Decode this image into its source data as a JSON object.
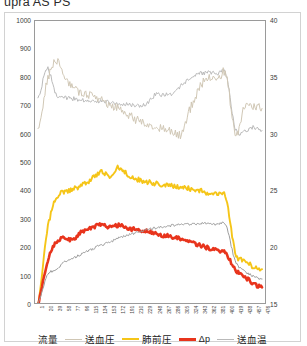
{
  "title": "upra AS PS",
  "axes": {
    "y_left": {
      "min": 0,
      "max": 1000,
      "step": 100,
      "ticks": [
        "1000",
        "900",
        "800",
        "700",
        "600",
        "500",
        "400",
        "300",
        "200",
        "100",
        "0"
      ]
    },
    "y_right": {
      "min": 15,
      "max": 40,
      "step": 5,
      "ticks": [
        "40",
        "35",
        "30",
        "25",
        "20",
        "15"
      ]
    },
    "x_ticks": [
      "1",
      "20",
      "39",
      "58",
      "77",
      "96",
      "115",
      "134",
      "153",
      "172",
      "191",
      "210",
      "229",
      "248",
      "267",
      "286",
      "305",
      "324",
      "343",
      "362",
      "381",
      "400",
      "419",
      "438",
      "457",
      "476"
    ]
  },
  "legend": {
    "items": [
      {
        "label": "流量",
        "name": "flow",
        "color": "#9b9b9b",
        "width": 1.2
      },
      {
        "label": "送血圧",
        "name": "arterial-pressure",
        "color": "#cfc6b4",
        "width": 1.4
      },
      {
        "label": "肺前圧",
        "name": "pre-lung-pressure",
        "color": "#f5c518",
        "width": 2.2
      },
      {
        "label": "Δp",
        "name": "delta-p",
        "color": "#e8341c",
        "width": 3.2
      },
      {
        "label": "送血温",
        "name": "blood-temperature",
        "color": "#b9b9b9",
        "width": 1.2
      }
    ]
  },
  "chart_data": {
    "type": "line",
    "title": "upra AS PS",
    "xlabel": "",
    "ylabel": "",
    "ylim": [
      0,
      1000
    ],
    "y2lim": [
      15,
      40
    ],
    "grid": false,
    "legend_position": "bottom",
    "x": [
      1,
      20,
      39,
      58,
      77,
      96,
      115,
      134,
      153,
      172,
      191,
      210,
      229,
      248,
      267,
      286,
      305,
      324,
      343,
      362,
      381,
      400,
      419,
      438,
      457,
      476
    ],
    "series": [
      {
        "name": "送血温",
        "axis": "right",
        "color": "#b9b9b9",
        "values": [
          33.0,
          35.8,
          33.6,
          33.2,
          33.1,
          33.0,
          32.9,
          32.9,
          32.8,
          32.7,
          32.6,
          32.5,
          32.6,
          33.4,
          33.5,
          33.6,
          34.3,
          34.9,
          35.3,
          35.4,
          35.3,
          35.2,
          30.5,
          30.2,
          30.6,
          30.3
        ]
      },
      {
        "name": "送血圧",
        "axis": "left",
        "color": "#cfc6b4",
        "values": [
          620,
          780,
          860,
          800,
          760,
          745,
          735,
          720,
          700,
          690,
          670,
          650,
          640,
          625,
          615,
          605,
          600,
          690,
          760,
          800,
          790,
          810,
          600,
          690,
          700,
          690
        ]
      },
      {
        "name": "肺前圧",
        "axis": "left",
        "color": "#f5c518",
        "values": [
          0,
          250,
          370,
          395,
          405,
          420,
          440,
          465,
          450,
          480,
          455,
          440,
          430,
          425,
          420,
          415,
          410,
          405,
          400,
          390,
          385,
          370,
          180,
          150,
          130,
          120
        ]
      },
      {
        "name": "Δp",
        "axis": "left",
        "color": "#e8341c",
        "values": [
          0,
          140,
          215,
          230,
          225,
          255,
          265,
          280,
          270,
          275,
          265,
          260,
          255,
          250,
          240,
          235,
          225,
          215,
          205,
          195,
          185,
          175,
          120,
          95,
          70,
          55
        ]
      },
      {
        "name": "流量",
        "axis": "left",
        "color": "#9b9b9b",
        "values": [
          0,
          95,
          120,
          145,
          160,
          175,
          190,
          205,
          215,
          230,
          240,
          250,
          258,
          265,
          270,
          275,
          278,
          280,
          282,
          281,
          278,
          272,
          150,
          115,
          95,
          85
        ]
      }
    ]
  }
}
